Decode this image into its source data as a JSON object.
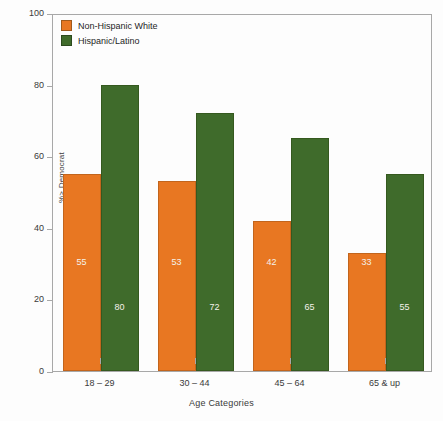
{
  "chart_data": {
    "type": "bar",
    "title": "",
    "xlabel": "Age Categories",
    "ylabel": "%> Democrat",
    "categories": [
      "18 – 29",
      "30 – 44",
      "45 – 64",
      "65 & up"
    ],
    "series": [
      {
        "name": "Non-Hispanic White",
        "color": "#E87722",
        "values": [
          55,
          53,
          42,
          33
        ]
      },
      {
        "name": "Hispanic/Latino",
        "color": "#3F6B2B",
        "values": [
          80,
          72,
          65,
          55
        ]
      }
    ],
    "ylim": [
      0,
      100
    ],
    "yticks": [
      0,
      20,
      40,
      60,
      80,
      100
    ],
    "grid": false,
    "legend_position": "top-left",
    "value_labels_shown": true,
    "value_label_color": "#F4F1EA"
  },
  "legend": {
    "items": [
      {
        "label": "Non-Hispanic White",
        "color": "#E87722"
      },
      {
        "label": "Hispanic/Latino",
        "color": "#3F6B2B"
      }
    ]
  },
  "axes": {
    "y_title": "%> Democrat",
    "x_title": "Age Categories",
    "y_tick_labels": [
      "0",
      "20",
      "40",
      "60",
      "80",
      "100"
    ],
    "x_tick_labels": [
      "18 – 29",
      "30 – 44",
      "45 – 64",
      "65 & up"
    ]
  },
  "colors": {
    "orange": "#E87722",
    "green": "#3F6B2B",
    "frame": "#A8A8A8",
    "background": "#FDFDFD",
    "text": "#3A3A3A"
  }
}
